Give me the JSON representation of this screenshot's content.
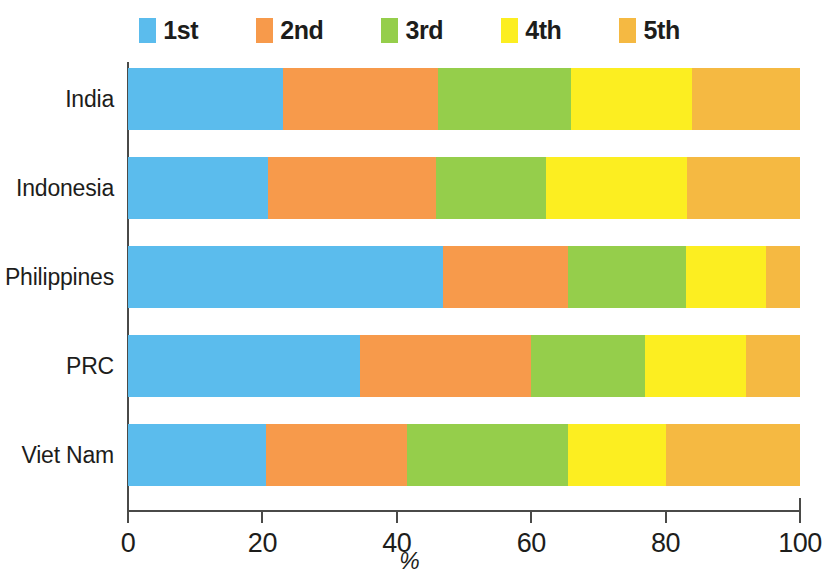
{
  "legend": {
    "position": "top",
    "items": [
      {
        "label": "1st",
        "color": "#5bbced",
        "icon": "legend-swatch-1st"
      },
      {
        "label": "2nd",
        "color": "#f79a4b",
        "icon": "legend-swatch-2nd"
      },
      {
        "label": "3rd",
        "color": "#95ce4b",
        "icon": "legend-swatch-3rd"
      },
      {
        "label": "4th",
        "color": "#fcee21",
        "icon": "legend-swatch-4th"
      },
      {
        "label": "5th",
        "color": "#f5b942",
        "icon": "legend-swatch-5th"
      }
    ]
  },
  "axis": {
    "x_title": "%",
    "x_ticks": [
      "0",
      "20",
      "40",
      "60",
      "80",
      "100"
    ],
    "y_categories": [
      "India",
      "Indonesia",
      "Philippines",
      "PRC",
      "Viet Nam"
    ]
  },
  "chart_data": {
    "type": "bar",
    "orientation": "horizontal",
    "stacked": true,
    "normalized": true,
    "title": "",
    "subtitle": "",
    "xlabel": "%",
    "ylabel": "",
    "xlim": [
      0,
      100
    ],
    "xticks": [
      0,
      20,
      40,
      60,
      80,
      100
    ],
    "grid": false,
    "legend_position": "top",
    "categories": [
      "India",
      "Indonesia",
      "Philippines",
      "PRC",
      "Viet Nam"
    ],
    "series": [
      {
        "name": "1st",
        "color": "#5bbced",
        "values": [
          23.0,
          20.8,
          46.9,
          34.5,
          20.5
        ]
      },
      {
        "name": "2nd",
        "color": "#f79a4b",
        "values": [
          23.1,
          25.0,
          18.6,
          25.5,
          21.0
        ]
      },
      {
        "name": "3rd",
        "color": "#95ce4b",
        "values": [
          19.8,
          16.4,
          17.5,
          17.0,
          24.0
        ]
      },
      {
        "name": "4th",
        "color": "#fcee21",
        "values": [
          18.0,
          21.0,
          11.9,
          15.0,
          14.5
        ]
      },
      {
        "name": "5th",
        "color": "#f5b942",
        "values": [
          16.1,
          16.8,
          5.1,
          8.0,
          20.0
        ]
      }
    ]
  }
}
